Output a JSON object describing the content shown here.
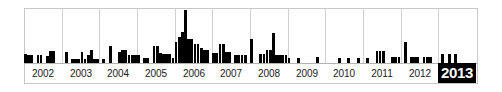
{
  "widget": {
    "name": "year-histogram-timeline",
    "background_color": "#ffffff",
    "frame_color": "#c8c8c8",
    "bar_color": "#000000",
    "gridline_color": "#d0d0d0",
    "selected_label_background": "#000000",
    "selected_label_color": "#ffffff"
  },
  "chart_data": {
    "type": "bar",
    "title": "",
    "subtitle": "",
    "xlabel": "",
    "ylabel": "",
    "grid": true,
    "legend": null,
    "legend_position": "none",
    "xlim": [
      2002,
      2014
    ],
    "ylim": [
      0,
      54
    ],
    "tick_labels": [
      "2002",
      "2003",
      "2004",
      "2005",
      "2006",
      "2007",
      "2008",
      "2009",
      "2010",
      "2011",
      "2012",
      "2013"
    ],
    "selected_tick": "2013",
    "annotation": "Monthly document counts per year; 2013 is the selected year.",
    "categories": [
      "2002-01",
      "2002-02",
      "2002-03",
      "2002-04",
      "2002-05",
      "2002-06",
      "2002-07",
      "2002-08",
      "2002-09",
      "2002-10",
      "2002-11",
      "2002-12",
      "2003-01",
      "2003-02",
      "2003-03",
      "2003-04",
      "2003-05",
      "2003-06",
      "2003-07",
      "2003-08",
      "2003-09",
      "2003-10",
      "2003-11",
      "2003-12",
      "2004-01",
      "2004-02",
      "2004-03",
      "2004-04",
      "2004-05",
      "2004-06",
      "2004-07",
      "2004-08",
      "2004-09",
      "2004-10",
      "2004-11",
      "2004-12",
      "2005-01",
      "2005-02",
      "2005-03",
      "2005-04",
      "2005-05",
      "2005-06",
      "2005-07",
      "2005-08",
      "2005-09",
      "2005-10",
      "2005-11",
      "2005-12",
      "2006-01",
      "2006-02",
      "2006-03",
      "2006-04",
      "2006-05",
      "2006-06",
      "2006-07",
      "2006-08",
      "2006-09",
      "2006-10",
      "2006-11",
      "2006-12",
      "2007-01",
      "2007-02",
      "2007-03",
      "2007-04",
      "2007-05",
      "2007-06",
      "2007-07",
      "2007-08",
      "2007-09",
      "2007-10",
      "2007-11",
      "2007-12",
      "2008-01",
      "2008-02",
      "2008-03",
      "2008-04",
      "2008-05",
      "2008-06",
      "2008-07",
      "2008-08",
      "2008-09",
      "2008-10",
      "2008-11",
      "2008-12",
      "2009-01",
      "2009-02",
      "2009-03",
      "2009-04",
      "2009-05",
      "2009-06",
      "2009-07",
      "2009-08",
      "2009-09",
      "2009-10",
      "2009-11",
      "2009-12",
      "2010-01",
      "2010-02",
      "2010-03",
      "2010-04",
      "2010-05",
      "2010-06",
      "2010-07",
      "2010-08",
      "2010-09",
      "2010-10",
      "2010-11",
      "2010-12",
      "2011-01",
      "2011-02",
      "2011-03",
      "2011-04",
      "2011-05",
      "2011-06",
      "2011-07",
      "2011-08",
      "2011-09",
      "2011-10",
      "2011-11",
      "2011-12",
      "2012-01",
      "2012-02",
      "2012-03",
      "2012-04",
      "2012-05",
      "2012-06",
      "2012-07",
      "2012-08",
      "2012-09",
      "2012-10",
      "2012-11",
      "2012-12",
      "2013-01",
      "2013-02",
      "2013-03",
      "2013-04",
      "2013-05",
      "2013-06",
      "2013-07",
      "2013-08",
      "2013-09",
      "2013-10",
      "2013-11",
      "2013-12"
    ],
    "values": [
      9,
      8,
      8,
      0,
      8,
      8,
      0,
      7,
      12,
      12,
      0,
      0,
      0,
      11,
      0,
      4,
      4,
      4,
      11,
      4,
      8,
      13,
      4,
      4,
      0,
      4,
      0,
      17,
      0,
      0,
      11,
      13,
      13,
      8,
      8,
      8,
      8,
      0,
      5,
      5,
      0,
      17,
      17,
      10,
      9,
      9,
      9,
      5,
      21,
      26,
      31,
      53,
      24,
      24,
      19,
      19,
      15,
      13,
      13,
      0,
      10,
      10,
      19,
      19,
      11,
      11,
      0,
      8,
      8,
      8,
      8,
      0,
      24,
      0,
      0,
      9,
      9,
      13,
      13,
      30,
      8,
      8,
      8,
      8,
      5,
      0,
      0,
      5,
      0,
      0,
      0,
      0,
      0,
      6,
      0,
      0,
      0,
      0,
      0,
      0,
      5,
      0,
      0,
      5,
      0,
      0,
      5,
      0,
      0,
      5,
      0,
      0,
      12,
      12,
      12,
      0,
      0,
      6,
      6,
      6,
      0,
      21,
      0,
      6,
      6,
      6,
      0,
      6,
      6,
      6,
      0,
      0,
      0,
      9,
      0,
      9,
      0,
      9,
      0,
      0,
      0,
      0,
      0,
      0
    ]
  }
}
